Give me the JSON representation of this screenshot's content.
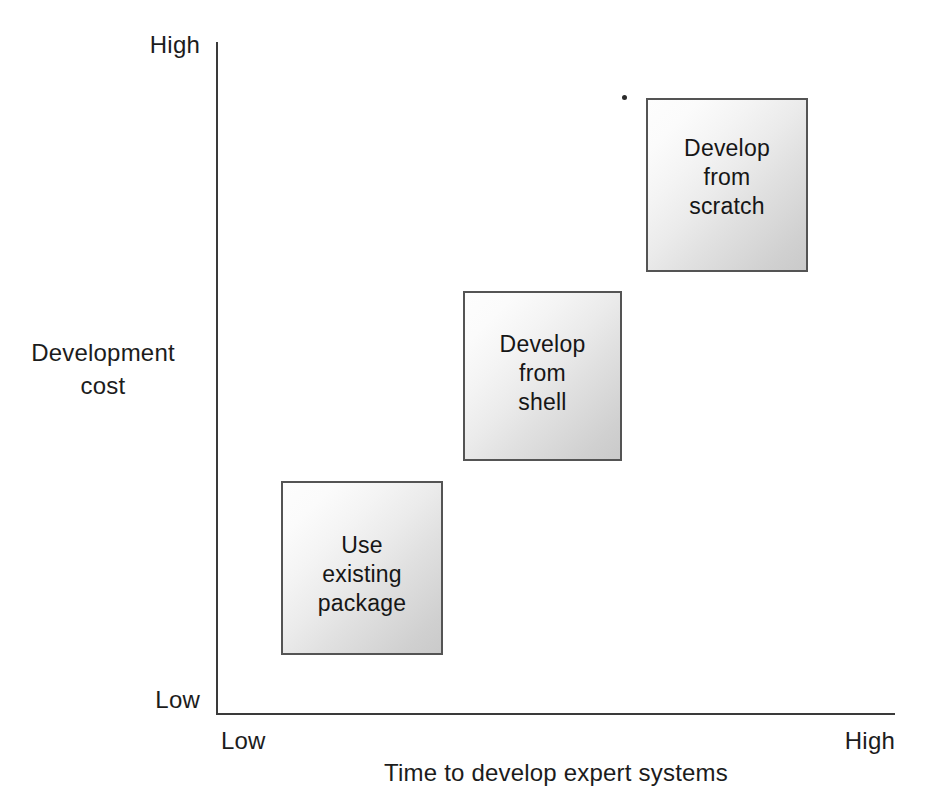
{
  "chart_data": {
    "type": "scatter",
    "title": "",
    "subtitle": "",
    "xlabel": "Time to develop expert systems",
    "ylabel": "Development cost",
    "ylabel_lines": [
      "Development",
      "cost"
    ],
    "x_tick_labels": [
      "Low",
      "High"
    ],
    "y_tick_labels": [
      "Low",
      "High"
    ],
    "xlim": [
      "Low",
      "High"
    ],
    "ylim": [
      "Low",
      "High"
    ],
    "grid": false,
    "legend": "none",
    "annotations": [
      {
        "id": "use-existing-package",
        "label": "Use\nexisting\npackage",
        "label_lines": [
          "Use",
          "existing",
          "package"
        ],
        "x_level": "low",
        "y_level": "low",
        "rank": 1
      },
      {
        "id": "develop-from-shell",
        "label": "Develop\nfrom\nshell",
        "label_lines": [
          "Develop",
          "from",
          "shell"
        ],
        "x_level": "medium",
        "y_level": "medium",
        "rank": 2
      },
      {
        "id": "develop-from-scratch",
        "label": "Develop\nfrom\nscratch",
        "label_lines": [
          "Develop",
          "from",
          "scratch"
        ],
        "x_level": "high",
        "y_level": "high",
        "rank": 3
      }
    ],
    "colors": {
      "axis": "#3a3a3a",
      "text": "#1c1c1c",
      "box_border": "#545454",
      "box_fill_light": "#fdfdfd",
      "box_fill_dark": "#cacaca",
      "background": "#ffffff"
    }
  },
  "axes": {
    "y": {
      "title_line1": "Development",
      "title_line2": "cost",
      "high_label": "High",
      "low_label": "Low"
    },
    "x": {
      "title": "Time to develop expert systems",
      "high_label": "High",
      "low_label": "Low"
    }
  },
  "boxes": {
    "use_existing_package": "Use\nexisting\npackage",
    "develop_from_shell": "Develop\nfrom\nshell",
    "develop_from_scratch": "Develop\nfrom\nscratch"
  }
}
